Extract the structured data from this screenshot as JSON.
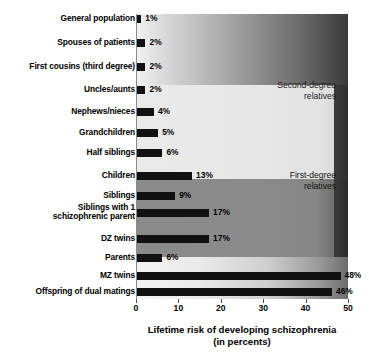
{
  "chart_data": {
    "type": "bar",
    "orientation": "horizontal",
    "title": "",
    "xlabel": "Lifetime risk of developing schizophrenia (in percents)",
    "xlabel_line1": "Lifetime risk of developing schizophrenia",
    "xlabel_line2": "(in percents)",
    "ylabel": "",
    "xlim": [
      0,
      53
    ],
    "xticks": [
      0,
      10,
      20,
      30,
      40,
      50
    ],
    "xtick_labels": [
      "0",
      "10",
      "20",
      "30",
      "40",
      "50"
    ],
    "grid": false,
    "legend_position": "none",
    "value_suffix": "%",
    "categories": [
      "General population",
      "Spouses of patients",
      "First cousins (third degree)",
      "Uncles/aunts",
      "Nephews/nieces",
      "Grandchildren",
      "Half siblings",
      "Children",
      "Siblings",
      "Siblings with 1 schizophrenic parent",
      "DZ twins",
      "Parents",
      "MZ twins",
      "Offspring of dual matings"
    ],
    "values": [
      1,
      2,
      2,
      2,
      4,
      5,
      6,
      13,
      9,
      17,
      17,
      6,
      48,
      46
    ],
    "value_labels": [
      "1%",
      "2%",
      "2%",
      "2%",
      "4%",
      "5%",
      "6%",
      "13%",
      "9%",
      "17%",
      "17%",
      "6%",
      "48%",
      "46%"
    ],
    "bars": [
      {
        "category": "General population",
        "label_line1": "General population",
        "label_line2": "",
        "value": 1,
        "value_label": "1%"
      },
      {
        "category": "Spouses of patients",
        "label_line1": "Spouses of patients",
        "label_line2": "",
        "value": 2,
        "value_label": "2%"
      },
      {
        "category": "First cousins (third degree)",
        "label_line1": "First cousins (third degree)",
        "label_line2": "",
        "value": 2,
        "value_label": "2%"
      },
      {
        "category": "Uncles/aunts",
        "label_line1": "Uncles/aunts",
        "label_line2": "",
        "value": 2,
        "value_label": "2%"
      },
      {
        "category": "Nephews/nieces",
        "label_line1": "Nephews/nieces",
        "label_line2": "",
        "value": 4,
        "value_label": "4%"
      },
      {
        "category": "Grandchildren",
        "label_line1": "Grandchildren",
        "label_line2": "",
        "value": 5,
        "value_label": "5%"
      },
      {
        "category": "Half siblings",
        "label_line1": "Half siblings",
        "label_line2": "",
        "value": 6,
        "value_label": "6%"
      },
      {
        "category": "Children",
        "label_line1": "Children",
        "label_line2": "",
        "value": 13,
        "value_label": "13%"
      },
      {
        "category": "Siblings",
        "label_line1": "Siblings",
        "label_line2": "",
        "value": 9,
        "value_label": "9%"
      },
      {
        "category": "Siblings with 1 schizophrenic parent",
        "label_line1": "Siblings with 1",
        "label_line2": "schizophrenic parent",
        "value": 17,
        "value_label": "17%"
      },
      {
        "category": "DZ twins",
        "label_line1": "DZ twins",
        "label_line2": "",
        "value": 17,
        "value_label": "17%"
      },
      {
        "category": "Parents",
        "label_line1": "Parents",
        "label_line2": "",
        "value": 6,
        "value_label": "6%"
      },
      {
        "category": "MZ twins",
        "label_line1": "MZ twins",
        "label_line2": "",
        "value": 48,
        "value_label": "48%"
      },
      {
        "category": "Offspring of dual matings",
        "label_line1": "Offspring of dual matings",
        "label_line2": "",
        "value": 46,
        "value_label": "46%"
      }
    ],
    "annotations": [
      {
        "name": "second-degree-relatives",
        "line1": "Second-degree",
        "line2": "relatives"
      },
      {
        "name": "first-degree-relatives",
        "line1": "First-degree",
        "line2": "relatives"
      }
    ],
    "colors": {
      "bar": "#111111",
      "axis": "#8a8a8a",
      "text": "#000000",
      "band_second_degree": "#eaeaea",
      "band_first_degree": "#8a8a8a",
      "plot_background": "#8d8d8d"
    }
  }
}
